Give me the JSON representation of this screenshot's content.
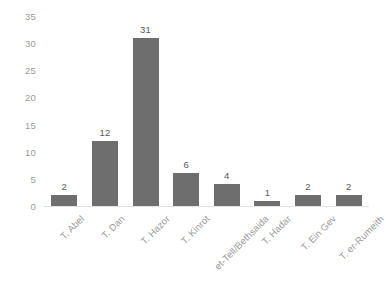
{
  "chart_data": {
    "type": "bar",
    "title": "",
    "subtitle": "",
    "xlabel": "",
    "ylabel": "",
    "categories": [
      "T. Abel",
      "T. Dan",
      "T. Hazor",
      "T. Kinrot",
      "et-Tell/Bethsaida",
      "T. Hadar",
      "T. Ein Gev",
      "T. er-Rumeith"
    ],
    "values": [
      2,
      12,
      31,
      6,
      4,
      1,
      2,
      2
    ],
    "data_labels": [
      "2",
      "12",
      "31",
      "6",
      "4",
      "1",
      "2",
      "2"
    ],
    "ylim": [
      0,
      35
    ],
    "yticks": [
      0,
      5,
      10,
      15,
      20,
      25,
      30,
      35
    ],
    "ytick_labels": [
      "0",
      "5",
      "10",
      "15",
      "20",
      "25",
      "30",
      "35"
    ],
    "grid": false,
    "legend": false,
    "legend_position": "none",
    "bar_color": "#6e6e6e",
    "label_color": "#585858",
    "tick_color": "#9a9a9a",
    "axis_color": "#e3e3e3",
    "background_color": "#ffffff",
    "xtick_rotation": -45
  }
}
